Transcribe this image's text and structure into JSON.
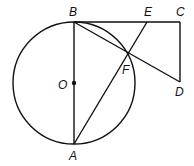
{
  "diagram": {
    "type": "geometry",
    "circle": {
      "center": "O",
      "cx": 74,
      "cy": 83,
      "r": 61
    },
    "points": {
      "B": {
        "x": 74,
        "y": 22,
        "label": "B",
        "lx": 69,
        "ly": 16
      },
      "E": {
        "x": 147,
        "y": 22,
        "label": "E",
        "lx": 144,
        "ly": 16
      },
      "C": {
        "x": 180,
        "y": 22,
        "label": "C",
        "lx": 176,
        "ly": 16
      },
      "D": {
        "x": 180,
        "y": 82,
        "label": "D",
        "lx": 175,
        "ly": 96
      },
      "F": {
        "x": 129,
        "y": 54,
        "label": "F",
        "lx": 122,
        "ly": 74
      },
      "O": {
        "x": 74,
        "y": 83,
        "label": "O",
        "lx": 58,
        "ly": 89
      },
      "A": {
        "x": 74,
        "y": 144,
        "label": "A",
        "lx": 69,
        "ly": 160
      }
    },
    "segments": [
      "BC",
      "CD",
      "BD",
      "BA",
      "AE",
      "BF"
    ]
  }
}
